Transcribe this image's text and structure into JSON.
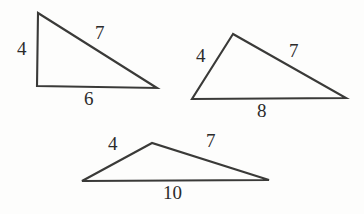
{
  "figure": {
    "background_color": "#fdfdfc",
    "stroke_color": "#3a3a38",
    "label_color": "#2b2b2b",
    "triangles": [
      {
        "name": "triangle-1",
        "description": "right triangle, left position",
        "vertices": [
          [
            38,
            13
          ],
          [
            37,
            86
          ],
          [
            157,
            88
          ]
        ],
        "labels": {
          "left_side": "4",
          "hypotenuse": "7",
          "base": "6"
        },
        "label_positions": {
          "left_side": [
            17,
            39
          ],
          "hypotenuse": [
            95,
            23
          ],
          "base": [
            84,
            89
          ]
        }
      },
      {
        "name": "triangle-2",
        "description": "scalene triangle, right position",
        "vertices": [
          [
            233,
            34
          ],
          [
            192,
            99
          ],
          [
            346,
            98
          ]
        ],
        "labels": {
          "left_side": "4",
          "right_side": "7",
          "base": "8"
        },
        "label_positions": {
          "left_side": [
            196,
            46
          ],
          "right_side": [
            289,
            41
          ],
          "base": [
            257,
            101
          ]
        }
      },
      {
        "name": "triangle-3",
        "description": "obtuse flat triangle, bottom position",
        "vertices": [
          [
            152,
            143
          ],
          [
            82,
            181
          ],
          [
            269,
            180
          ]
        ],
        "labels": {
          "left_side": "4",
          "right_side": "7",
          "base": "10"
        },
        "label_positions": {
          "left_side": [
            108,
            134
          ],
          "right_side": [
            206,
            131
          ],
          "base": [
            163,
            183
          ]
        }
      }
    ]
  }
}
